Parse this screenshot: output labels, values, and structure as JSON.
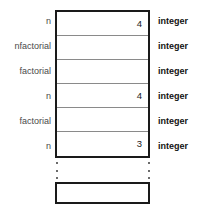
{
  "diagram": {
    "colors": {
      "outline": "#1a1a1a",
      "divider": "#8a8a8a",
      "name_text": "#4a4a4a",
      "type_text": "#111111",
      "background": "#ffffff"
    },
    "rows": [
      {
        "name": "n",
        "value": "4",
        "type": "integer"
      },
      {
        "name": "nfactorial",
        "value": "",
        "type": "integer"
      },
      {
        "name": "factorial",
        "value": "",
        "type": "integer"
      },
      {
        "name": "n",
        "value": "4",
        "type": "integer"
      },
      {
        "name": "factorial",
        "value": "",
        "type": "integer"
      },
      {
        "name": "n",
        "value": "3",
        "type": "integer"
      }
    ],
    "ellipsis": {
      "dots": 3
    },
    "bottom_box": {
      "name": "empty-frame",
      "value": ""
    }
  }
}
